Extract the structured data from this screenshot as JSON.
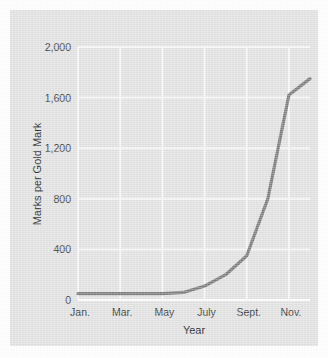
{
  "chart_data": {
    "type": "line",
    "title": "",
    "xlabel": "Year",
    "ylabel": "Marks per Gold Mark",
    "categories": [
      "Jan.",
      "Feb.",
      "Mar.",
      "Apr.",
      "May",
      "June",
      "July",
      "Aug.",
      "Sept.",
      "Oct.",
      "Nov.",
      "Dec."
    ],
    "x_tick_labels": [
      "Jan.",
      "Mar.",
      "May",
      "July",
      "Sept.",
      "Nov."
    ],
    "y_tick_labels": [
      "0",
      "400",
      "800",
      "1,200",
      "1,600",
      "2,000"
    ],
    "y_tick_values": [
      0,
      400,
      800,
      1200,
      1600,
      2000
    ],
    "ylim": [
      0,
      2000
    ],
    "xlim": [
      0,
      11
    ],
    "grid": true,
    "legend": "none",
    "series": [
      {
        "name": "Marks per Gold Mark",
        "color": "#7d7d7d",
        "values": [
          50,
          50,
          50,
          50,
          50,
          60,
          110,
          200,
          350,
          800,
          1620,
          1750
        ]
      }
    ]
  },
  "figure": {
    "panel_color": "#e3e3e3",
    "grid_color": "#f5f5f5",
    "line_color": "#7d7d7d",
    "text_color": "#3a3a3a"
  }
}
